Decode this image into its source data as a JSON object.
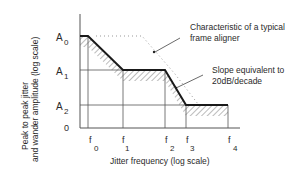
{
  "figure": {
    "y_axis_label_line1": "Peak to peak jitter",
    "y_axis_label_line2": "and wander amplitude (log scale)",
    "x_axis_label": "Jitter frequency (log scale)",
    "y_ticks": [
      {
        "main": "A",
        "sub": "0"
      },
      {
        "main": "A",
        "sub": "1"
      },
      {
        "main": "A",
        "sub": "2"
      },
      {
        "main": "0",
        "sub": ""
      }
    ],
    "x_ticks": [
      {
        "main": "f",
        "sub": "0"
      },
      {
        "main": "f",
        "sub": "1"
      },
      {
        "main": "f",
        "sub": "2"
      },
      {
        "main": "f",
        "sub": "3"
      },
      {
        "main": "f",
        "sub": "4"
      }
    ],
    "annotation_frame_aligner_line1": "Characteristic of a typical",
    "annotation_frame_aligner_line2": "frame aligner",
    "annotation_slope_line1": "Slope equivalent to",
    "annotation_slope_line2": "20dB/decade"
  },
  "colors": {
    "line": "#1a1a1a",
    "grid": "#555555",
    "hatch": "#777777",
    "dotted": "#999999"
  }
}
